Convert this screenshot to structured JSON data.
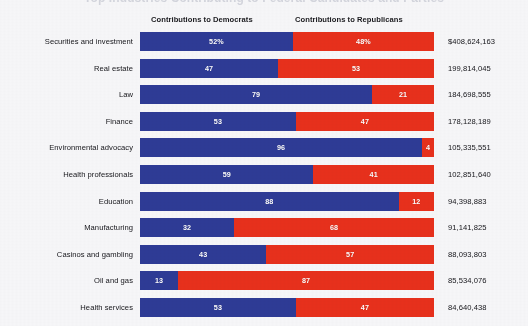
{
  "title_clipped": "Top Industries Contributing to Federal Candidates and Parties",
  "headers": {
    "democrats": "Contributions to Democrats",
    "republicans": "Contributions to Republicans"
  },
  "colors": {
    "democrat_blue": "#2e3b96",
    "republican_red": "#e8301c",
    "background": "#f7f7f9",
    "text": "#15151a"
  },
  "chart_data": {
    "type": "bar",
    "subtype": "horizontal-100-percent-stacked",
    "title": "Top Industries Contributing to Federal Candidates and Parties",
    "xlabel": "",
    "ylabel": "",
    "xlim": [
      0,
      100
    ],
    "grid": false,
    "legend_position": "top",
    "categories": [
      "Securities and investment",
      "Real estate",
      "Law",
      "Finance",
      "Environmental advocacy",
      "Health professionals",
      "Education",
      "Manufacturing",
      "Casinos and gambling",
      "Oil and gas",
      "Health services"
    ],
    "series": [
      {
        "name": "Contributions to Democrats",
        "color": "#2e3b96",
        "values": [
          52,
          47,
          79,
          53,
          96,
          59,
          88,
          32,
          43,
          13,
          53
        ]
      },
      {
        "name": "Contributions to Republicans",
        "color": "#e8301c",
        "values": [
          48,
          53,
          21,
          47,
          4,
          41,
          12,
          68,
          57,
          87,
          47
        ]
      }
    ],
    "totals": [
      "$408,624,163",
      "199,814,045",
      "184,698,555",
      "178,128,189",
      "105,335,551",
      "102,851,640",
      "94,398,883",
      "91,141,825",
      "88,093,803",
      "85,534,076",
      "84,640,438"
    ]
  },
  "rows": [
    {
      "label": "Securities and investment",
      "dem": 52,
      "rep": 48,
      "dem_text": "52%",
      "rep_text": "48%",
      "total": "$408,624,163"
    },
    {
      "label": "Real estate",
      "dem": 47,
      "rep": 53,
      "dem_text": "47",
      "rep_text": "53",
      "total": "199,814,045"
    },
    {
      "label": "Law",
      "dem": 79,
      "rep": 21,
      "dem_text": "79",
      "rep_text": "21",
      "total": "184,698,555"
    },
    {
      "label": "Finance",
      "dem": 53,
      "rep": 47,
      "dem_text": "53",
      "rep_text": "47",
      "total": "178,128,189"
    },
    {
      "label": "Environmental advocacy",
      "dem": 96,
      "rep": 4,
      "dem_text": "96",
      "rep_text": "4",
      "total": "105,335,551"
    },
    {
      "label": "Health professionals",
      "dem": 59,
      "rep": 41,
      "dem_text": "59",
      "rep_text": "41",
      "total": "102,851,640"
    },
    {
      "label": "Education",
      "dem": 88,
      "rep": 12,
      "dem_text": "88",
      "rep_text": "12",
      "total": "94,398,883"
    },
    {
      "label": "Manufacturing",
      "dem": 32,
      "rep": 68,
      "dem_text": "32",
      "rep_text": "68",
      "total": "91,141,825"
    },
    {
      "label": "Casinos and gambling",
      "dem": 43,
      "rep": 57,
      "dem_text": "43",
      "rep_text": "57",
      "total": "88,093,803"
    },
    {
      "label": "Oil and gas",
      "dem": 13,
      "rep": 87,
      "dem_text": "13",
      "rep_text": "87",
      "total": "85,534,076"
    },
    {
      "label": "Health services",
      "dem": 53,
      "rep": 47,
      "dem_text": "53",
      "rep_text": "47",
      "total": "84,640,438"
    }
  ]
}
